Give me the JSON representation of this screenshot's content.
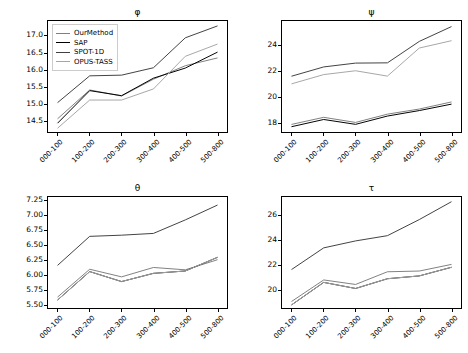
{
  "figure": {
    "background": "#ffffff",
    "layout": "2x2 grid of line charts",
    "width": 468,
    "height": 353
  },
  "legend": {
    "position": "upper-left of phi panel",
    "entries": [
      {
        "label": "OurMethod",
        "color": "#7f7f7f"
      },
      {
        "label": "SAP",
        "color": "#000000"
      },
      {
        "label": "SPOT-1D",
        "color": "#404040"
      },
      {
        "label": "OPUS-TASS",
        "color": "#a6a6a6"
      }
    ]
  },
  "chart_data": [
    {
      "type": "line",
      "title": "φ",
      "xlabel": "",
      "ylabel": "",
      "grid": false,
      "legend_position": "upper left",
      "categories": [
        "000-100",
        "100-200",
        "200-300",
        "300-400",
        "400-500",
        "500-800"
      ],
      "yticks": [
        14.5,
        15.0,
        15.5,
        16.0,
        16.5,
        17.0
      ],
      "ylim": [
        14.15,
        17.45
      ],
      "series": [
        {
          "name": "OurMethod",
          "color": "#7f7f7f",
          "values": [
            14.55,
            15.4,
            15.22,
            15.72,
            16.12,
            16.35
          ]
        },
        {
          "name": "SAP",
          "color": "#000000",
          "values": [
            14.42,
            15.38,
            15.23,
            15.75,
            16.05,
            16.52
          ]
        },
        {
          "name": "SPOT-1D",
          "color": "#404040",
          "values": [
            15.03,
            15.82,
            15.84,
            16.06,
            16.95,
            17.3
          ]
        },
        {
          "name": "OPUS-TASS",
          "color": "#a6a6a6",
          "values": [
            14.27,
            15.1,
            15.1,
            15.43,
            16.4,
            16.76
          ]
        }
      ]
    },
    {
      "type": "line",
      "title": "ψ",
      "xlabel": "",
      "ylabel": "",
      "grid": false,
      "legend_position": "none",
      "categories": [
        "000-100",
        "100-200",
        "200-300",
        "300-400",
        "400-500",
        "500-800"
      ],
      "yticks": [
        18,
        20,
        22,
        24
      ],
      "ylim": [
        17.2,
        25.9
      ],
      "series": [
        {
          "name": "OurMethod",
          "color": "#7f7f7f",
          "values": [
            17.8,
            18.35,
            17.95,
            18.6,
            19.0,
            19.55
          ]
        },
        {
          "name": "SAP",
          "color": "#000000",
          "values": [
            17.62,
            18.18,
            17.8,
            18.45,
            18.88,
            19.38
          ]
        },
        {
          "name": "SPOT-1D",
          "color": "#404040",
          "values": [
            21.58,
            22.3,
            22.6,
            22.62,
            24.3,
            25.45
          ]
        },
        {
          "name": "OPUS-TASS",
          "color": "#a6a6a6",
          "values": [
            20.98,
            21.7,
            22.0,
            21.58,
            23.78,
            24.35
          ]
        }
      ]
    },
    {
      "type": "line",
      "title": "θ",
      "xlabel": "",
      "ylabel": "",
      "grid": false,
      "legend_position": "none",
      "categories": [
        "000-100",
        "100-200",
        "200-300",
        "300-400",
        "400-500",
        "500-800"
      ],
      "yticks": [
        5.5,
        5.75,
        6.0,
        6.25,
        6.5,
        6.75,
        7.0,
        7.25
      ],
      "ylim": [
        5.43,
        7.32
      ],
      "series": [
        {
          "name": "OurMethod",
          "color": "#7f7f7f",
          "values": [
            5.62,
            6.09,
            5.96,
            6.12,
            6.08,
            6.25
          ]
        },
        {
          "name": "SAP",
          "color": "#000000",
          "values": [
            5.57,
            6.05,
            5.88,
            6.02,
            6.06,
            6.29
          ]
        },
        {
          "name": "SPOT-1D",
          "color": "#404040",
          "values": [
            6.16,
            6.65,
            6.67,
            6.7,
            6.93,
            7.18
          ]
        },
        {
          "name": "OPUS-TASS",
          "color": "#a6a6a6",
          "values": [
            5.57,
            6.05,
            5.88,
            6.02,
            6.06,
            6.29
          ]
        }
      ]
    },
    {
      "type": "line",
      "title": "τ",
      "xlabel": "",
      "ylabel": "",
      "grid": false,
      "legend_position": "none",
      "categories": [
        "000-100",
        "100-200",
        "200-300",
        "300-400",
        "400-500",
        "500-800"
      ],
      "yticks": [
        20,
        22,
        24,
        26
      ],
      "ylim": [
        18.45,
        27.55
      ],
      "series": [
        {
          "name": "OurMethod",
          "color": "#7f7f7f",
          "values": [
            19.0,
            20.75,
            20.38,
            21.42,
            21.48,
            22.02
          ]
        },
        {
          "name": "SAP",
          "color": "#000000",
          "values": [
            18.72,
            20.55,
            20.05,
            20.85,
            21.08,
            21.78
          ]
        },
        {
          "name": "SPOT-1D",
          "color": "#404040",
          "values": [
            21.62,
            23.38,
            23.95,
            24.38,
            25.7,
            27.15
          ]
        },
        {
          "name": "OPUS-TASS",
          "color": "#a6a6a6",
          "values": [
            18.72,
            20.55,
            20.05,
            20.85,
            21.08,
            21.78
          ]
        }
      ]
    }
  ]
}
